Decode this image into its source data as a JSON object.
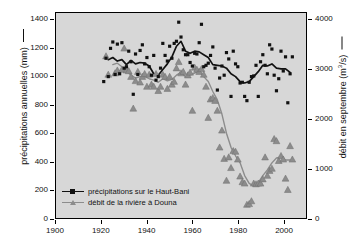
{
  "chart_data": {
    "type": "scatter",
    "title": "",
    "subtitle": "",
    "xlabel": "",
    "ylabel": "précipitations annuelles (mm)",
    "ylabel_right": "débit en septembre (m3/s)",
    "xlim": [
      1900,
      2010
    ],
    "ylim": [
      0,
      1450
    ],
    "ylim_right": [
      0,
      4143
    ],
    "xticks": [
      1900,
      1920,
      1940,
      1960,
      1980,
      2000
    ],
    "xticklabels": [
      "1900",
      "1920",
      "1940",
      "1960",
      "1980",
      "2000"
    ],
    "yticks": [
      0,
      200,
      400,
      600,
      800,
      1000,
      1200,
      1400
    ],
    "yticklabels": [
      "0",
      "200",
      "400",
      "600",
      "800",
      "1000",
      "1200",
      "1400"
    ],
    "yticks_right": [
      0,
      1000,
      2000,
      3000,
      4000
    ],
    "yticklabels_right": [
      "0",
      "1000",
      "2000",
      "3000",
      "4000"
    ],
    "grid": false,
    "legend_position": "lower-left",
    "background": "#d7d7d7",
    "series": [
      {
        "name": "précipitations sur le Haut-Bani",
        "axis": "left",
        "color": "#111111",
        "marker": "square",
        "marker_size": 3.2,
        "line_width": 1.7,
        "has_points": true,
        "has_smooth_line": true,
        "x": [
          1921,
          1922,
          1923,
          1924,
          1925,
          1926,
          1927,
          1928,
          1929,
          1930,
          1931,
          1932,
          1933,
          1934,
          1935,
          1936,
          1937,
          1938,
          1939,
          1940,
          1941,
          1942,
          1943,
          1944,
          1945,
          1946,
          1947,
          1948,
          1949,
          1950,
          1951,
          1952,
          1953,
          1954,
          1955,
          1956,
          1957,
          1958,
          1959,
          1960,
          1961,
          1962,
          1963,
          1964,
          1965,
          1966,
          1967,
          1968,
          1969,
          1970,
          1971,
          1972,
          1973,
          1974,
          1975,
          1976,
          1977,
          1978,
          1979,
          1980,
          1981,
          1982,
          1983,
          1984,
          1985,
          1986,
          1987,
          1988,
          1989,
          1990,
          1991,
          1992,
          1993,
          1994,
          1995,
          1996,
          1997,
          1998,
          1999,
          2000,
          2001,
          2002,
          2003,
          2004
        ],
        "y": [
          965,
          1130,
          1000,
          1200,
          1245,
          1015,
          1230,
          1020,
          1240,
          1060,
          1070,
          1180,
          1105,
          875,
          1160,
          1015,
          1185,
          1225,
          1090,
          1135,
          1070,
          1010,
          1150,
          975,
          1000,
          1060,
          1235,
          1150,
          1110,
          1215,
          1130,
          1235,
          1250,
          1385,
          1280,
          1190,
          1155,
          1155,
          1100,
          1075,
          1165,
          1160,
          1240,
          1370,
          1070,
          1080,
          1095,
          1150,
          1210,
          1060,
          905,
          990,
          1075,
          1010,
          1170,
          1125,
          860,
          1180,
          1090,
          1070,
          955,
          960,
          860,
          830,
          960,
          1000,
          1005,
          1080,
          860,
          1105,
          1155,
          1080,
          1020,
          1225,
          1195,
          1010,
          900,
          985,
          1180,
          1040,
          1140,
          815,
          1020,
          1140
        ]
      },
      {
        "name": "débit de la rivière à Douna",
        "axis": "right",
        "color": "#8c8c8c",
        "marker": "triangle",
        "marker_size": 3.4,
        "line_width": 1.4,
        "has_points": true,
        "has_smooth_line": true,
        "x": [
          1922,
          1923,
          1924,
          1925,
          1926,
          1927,
          1928,
          1929,
          1930,
          1931,
          1932,
          1933,
          1934,
          1935,
          1936,
          1937,
          1938,
          1939,
          1940,
          1941,
          1942,
          1943,
          1944,
          1945,
          1946,
          1947,
          1948,
          1949,
          1950,
          1951,
          1952,
          1953,
          1954,
          1955,
          1956,
          1957,
          1958,
          1959,
          1960,
          1961,
          1962,
          1963,
          1964,
          1965,
          1966,
          1967,
          1968,
          1969,
          1970,
          1971,
          1972,
          1973,
          1974,
          1975,
          1976,
          1977,
          1978,
          1979,
          1980,
          1981,
          1982,
          1983,
          1984,
          1985,
          1986,
          1987,
          1988,
          1989,
          1990,
          1991,
          1992,
          1993,
          1994,
          1995,
          1996,
          1997,
          1998,
          1999,
          2000,
          2001,
          2002,
          2003,
          2004
        ],
        "y_mm_scale": [
          1145,
          1015,
          2010,
          3345,
          1025,
          1045,
          1680,
          1050,
          1200,
          1045,
          1040,
          1000,
          775,
          970,
          1035,
          960,
          1000,
          1020,
          930,
          1015,
          945,
          930,
          1020,
          900,
          930,
          1015,
          1000,
          915,
          1000,
          945,
          965,
          1060,
          1105,
          1025,
          1035,
          945,
          1010,
          1030,
          760,
          1065,
          1050,
          1035,
          1055,
          1015,
          930,
          710,
          840,
          850,
          830,
          760,
          500,
          620,
          420,
          265,
          430,
          355,
          475,
          470,
          415,
          295,
          255,
          245,
          95,
          100,
          120,
          245,
          240,
          245,
          245,
          275,
          430,
          300,
          335,
          350,
          560,
          545,
          405,
          440,
          415,
          280,
          200,
          510,
          415
        ]
      }
    ],
    "smooth_lines": {
      "precipitation": {
        "x": [
          1923,
          1925,
          1927,
          1929,
          1931,
          1933,
          1935,
          1937,
          1939,
          1941,
          1943,
          1945,
          1947,
          1949,
          1951,
          1953,
          1955,
          1957,
          1959,
          1961,
          1963,
          1965,
          1967,
          1969,
          1971,
          1973,
          1975,
          1977,
          1979,
          1981,
          1983,
          1985,
          1987,
          1989,
          1991,
          1993,
          1995,
          1997,
          1999,
          2001,
          2003
        ],
        "y": [
          1120,
          1135,
          1110,
          1120,
          1085,
          1115,
          1090,
          1100,
          1095,
          1075,
          1020,
          1010,
          1050,
          1090,
          1140,
          1215,
          1250,
          1180,
          1165,
          1180,
          1175,
          1155,
          1135,
          1085,
          1080,
          1075,
          1060,
          1020,
          1000,
          965,
          955,
          965,
          1000,
          1035,
          1080,
          1075,
          1090,
          1060,
          1055,
          1055,
          1030
        ]
      },
      "discharge": {
        "x": [
          1925,
          1927,
          1929,
          1931,
          1933,
          1935,
          1937,
          1939,
          1941,
          1943,
          1945,
          1947,
          1949,
          1951,
          1953,
          1955,
          1957,
          1959,
          1961,
          1963,
          1965,
          1967,
          1969,
          1971,
          1973,
          1975,
          1977,
          1979,
          1981,
          1983,
          1985,
          1987,
          1989,
          1991,
          1993,
          1995,
          1997,
          1999,
          2001,
          2003
        ],
        "y_mm_scale": [
          1085,
          1095,
          1070,
          1040,
          1010,
          990,
          1000,
          1000,
          985,
          975,
          960,
          985,
          970,
          980,
          1010,
          1030,
          1000,
          1010,
          1025,
          1040,
          1000,
          965,
          895,
          835,
          735,
          600,
          500,
          440,
          390,
          300,
          245,
          225,
          250,
          300,
          340,
          390,
          425,
          430,
          410,
          410
        ]
      }
    }
  },
  "legend": {
    "items": [
      {
        "label": "précipitations sur le Haut-Bani",
        "color": "#111111",
        "marker": "square"
      },
      {
        "label": "débit de la rivière à Douna",
        "color": "#8c8c8c",
        "marker": "triangle"
      }
    ]
  },
  "axes": {
    "left_title": "précipitations annuelles (mm)",
    "right_title": "débit en septembre (m3/s)"
  }
}
